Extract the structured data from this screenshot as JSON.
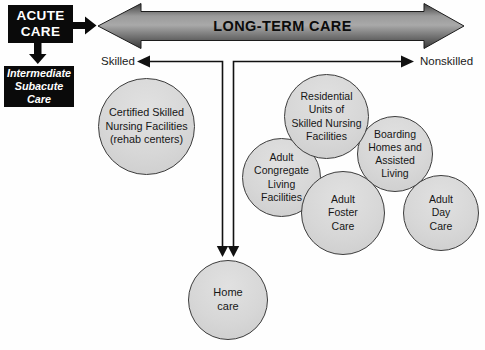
{
  "acute_care": {
    "label": "ACUTE\nCARE"
  },
  "intermediate_subacute": {
    "label": "Intermediate\nSubacute\nCare"
  },
  "long_term_care": {
    "label": "LONG-TERM CARE"
  },
  "axis": {
    "left_label": "Skilled",
    "right_label": "Nonskilled"
  },
  "facilities": [
    {
      "id": "certified-skilled-nursing-facilities",
      "label": "Certified Skilled\nNursing Facilities\n(rehab centers)"
    },
    {
      "id": "residential-units-skilled-nursing",
      "label": "Residential\nUnits of\nSkilled Nursing\nFacilities"
    },
    {
      "id": "boarding-homes-assisted-living",
      "label": "Boarding\nHomes and\nAssisted\nLiving"
    },
    {
      "id": "adult-congregate-living-facilities",
      "label": "Adult\nCongregate\nLiving\nFacilities"
    },
    {
      "id": "adult-foster-care",
      "label": "Adult\nFoster\nCare"
    },
    {
      "id": "adult-day-care",
      "label": "Adult\nDay\nCare"
    },
    {
      "id": "home-care",
      "label": "Home\ncare"
    }
  ],
  "colors": {
    "box_bg": "#0a0a0a",
    "box_text": "#ffffff",
    "circle_fill": "#d7d7d7",
    "circle_border": "#3c3c3c",
    "arrow_gradient_dark": "#3f3f3f",
    "arrow_gradient_light": "#a9a9a9",
    "line": "#111111"
  }
}
